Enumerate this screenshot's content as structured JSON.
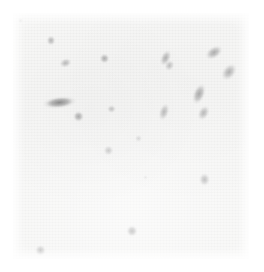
{
  "figure": {
    "kind": "micrograph",
    "modality": "brightfield-grayscale",
    "caption": "",
    "field": {
      "left": 13,
      "top": 13,
      "width": 236,
      "height": 246,
      "background_color": "#f7f7f6",
      "page_color": "#ffffff",
      "grain": "fine",
      "border": "none"
    }
  },
  "chart_data": {
    "type": "scatter",
    "title": "",
    "subtitle": "",
    "xlabel": "",
    "ylabel": "",
    "xlim": [
      0,
      236
    ],
    "ylim": [
      0,
      246
    ],
    "grid": false,
    "legend": "none",
    "annotations": [],
    "note": "Positions are in micrograph-field pixel coordinates; w/h are object extents, angle in degrees, intensity is relative darkness 0-1.",
    "objects": [
      {
        "id": "obj-01",
        "shape": "dot",
        "x": 5,
        "y": 5,
        "w": 5,
        "h": 5,
        "angle": 0,
        "intensity": 0.18,
        "core": "#c9c9c9",
        "mid": "#dedede"
      },
      {
        "id": "obj-02",
        "shape": "dot",
        "x": 33,
        "y": 22,
        "w": 9,
        "h": 10,
        "angle": 0,
        "intensity": 0.42,
        "core": "#9e9e9e",
        "mid": "#c4c4c4"
      },
      {
        "id": "obj-03",
        "shape": "rod",
        "x": 46,
        "y": 45,
        "w": 12,
        "h": 9,
        "angle": -20,
        "intensity": 0.4,
        "core": "#a2a2a2",
        "mid": "#c6c6c6"
      },
      {
        "id": "obj-04",
        "shape": "dot",
        "x": 86,
        "y": 40,
        "w": 10,
        "h": 10,
        "angle": 0,
        "intensity": 0.45,
        "core": "#9a9a9a",
        "mid": "#c0c0c0"
      },
      {
        "id": "obj-05",
        "shape": "rod",
        "x": 148,
        "y": 37,
        "w": 10,
        "h": 17,
        "angle": 25,
        "intensity": 0.44,
        "core": "#9c9c9c",
        "mid": "#c2c2c2"
      },
      {
        "id": "obj-06",
        "shape": "rod",
        "x": 152,
        "y": 47,
        "w": 9,
        "h": 11,
        "angle": 30,
        "intensity": 0.38,
        "core": "#a8a8a8",
        "mid": "#cacaca"
      },
      {
        "id": "obj-07",
        "shape": "rod",
        "x": 192,
        "y": 34,
        "w": 19,
        "h": 12,
        "angle": -32,
        "intensity": 0.46,
        "core": "#989898",
        "mid": "#bfbfbf"
      },
      {
        "id": "obj-08",
        "shape": "rod",
        "x": 210,
        "y": 50,
        "w": 13,
        "h": 19,
        "angle": 38,
        "intensity": 0.44,
        "core": "#9c9c9c",
        "mid": "#c2c2c2"
      },
      {
        "id": "obj-09",
        "shape": "cluster",
        "x": 29,
        "y": 83,
        "w": 34,
        "h": 12,
        "angle": -6,
        "intensity": 0.62,
        "core": "#7b7b7b",
        "mid": "#ababab"
      },
      {
        "id": "obj-10",
        "shape": "dot",
        "x": 60,
        "y": 98,
        "w": 11,
        "h": 11,
        "angle": 0,
        "intensity": 0.52,
        "core": "#8e8e8e",
        "mid": "#b6b6b6"
      },
      {
        "id": "obj-11",
        "shape": "dot",
        "x": 94,
        "y": 92,
        "w": 9,
        "h": 8,
        "angle": 0,
        "intensity": 0.4,
        "core": "#a3a3a3",
        "mid": "#c6c6c6"
      },
      {
        "id": "obj-12",
        "shape": "rod",
        "x": 146,
        "y": 90,
        "w": 10,
        "h": 18,
        "angle": 18,
        "intensity": 0.45,
        "core": "#9a9a9a",
        "mid": "#c0c0c0"
      },
      {
        "id": "obj-13",
        "shape": "rod",
        "x": 180,
        "y": 70,
        "w": 12,
        "h": 22,
        "angle": 22,
        "intensity": 0.5,
        "core": "#929292",
        "mid": "#b9b9b9"
      },
      {
        "id": "obj-14",
        "shape": "rod",
        "x": 185,
        "y": 92,
        "w": 11,
        "h": 16,
        "angle": 28,
        "intensity": 0.44,
        "core": "#9c9c9c",
        "mid": "#c2c2c2"
      },
      {
        "id": "obj-15",
        "shape": "dot",
        "x": 90,
        "y": 132,
        "w": 10,
        "h": 10,
        "angle": 0,
        "intensity": 0.4,
        "core": "#a3a3a3",
        "mid": "#c6c6c6"
      },
      {
        "id": "obj-16",
        "shape": "dot",
        "x": 122,
        "y": 122,
        "w": 7,
        "h": 7,
        "angle": 0,
        "intensity": 0.3,
        "core": "#b5b5b5",
        "mid": "#d2d2d2"
      },
      {
        "id": "obj-17",
        "shape": "dot",
        "x": 130,
        "y": 162,
        "w": 5,
        "h": 5,
        "angle": 0,
        "intensity": 0.16,
        "core": "#cbcbcb",
        "mid": "#e0e0e0"
      },
      {
        "id": "obj-18",
        "shape": "dot",
        "x": 186,
        "y": 160,
        "w": 11,
        "h": 13,
        "angle": 0,
        "intensity": 0.44,
        "core": "#9c9c9c",
        "mid": "#c2c2c2"
      },
      {
        "id": "obj-19",
        "shape": "dot",
        "x": 113,
        "y": 212,
        "w": 12,
        "h": 12,
        "angle": 0,
        "intensity": 0.5,
        "core": "#929292",
        "mid": "#b9b9b9"
      },
      {
        "id": "obj-20",
        "shape": "dot",
        "x": 22,
        "y": 232,
        "w": 11,
        "h": 11,
        "angle": 0,
        "intensity": 0.44,
        "core": "#9c9c9c",
        "mid": "#c2c2c2"
      }
    ]
  }
}
